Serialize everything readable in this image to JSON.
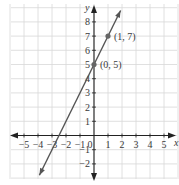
{
  "chart_data": {
    "type": "line",
    "title": "",
    "xlabel": "x",
    "ylabel": "y",
    "xlim": [
      -6,
      6
    ],
    "ylim": [
      -3,
      9
    ],
    "grid": true,
    "x_ticks": [
      -5,
      -4,
      -3,
      -2,
      -1,
      0,
      1,
      2,
      3,
      4,
      5
    ],
    "y_ticks": [
      -2,
      -1,
      1,
      2,
      3,
      4,
      5,
      6,
      7,
      8
    ],
    "x_tick_labels": [
      "−5",
      "−4",
      "−3",
      "−2",
      "−1",
      "0",
      "1",
      "2",
      "3",
      "4",
      "5"
    ],
    "y_tick_labels": [
      "−2",
      "−1",
      "1",
      "2",
      "3",
      "4",
      "5",
      "6",
      "7",
      "8"
    ],
    "series": [
      {
        "name": "y = 2x + 5",
        "slope": 2,
        "intercept": 5,
        "x": [
          -3.9,
          1.9
        ],
        "y": [
          -2.8,
          8.8
        ]
      }
    ],
    "points": [
      {
        "x": 0,
        "y": 5,
        "label": "(0, 5)"
      },
      {
        "x": 1,
        "y": 7,
        "label": "(1, 7)"
      }
    ],
    "colors": {
      "line": "#555555",
      "grid": "#d8d8d8",
      "axis": "#222222",
      "text": "#3a3a3a"
    }
  }
}
